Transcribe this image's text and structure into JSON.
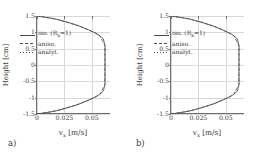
{
  "figure": {
    "panels": [
      {
        "letter": "a)",
        "xlabel_main": "v",
        "xlabel_sub": "x",
        "xlabel_unit": "[m/s]",
        "ylabel": "Height [cm]",
        "legend": [
          {
            "style": "solid",
            "label_main": "iso. (R",
            "label_sub": "b",
            "label_tail": "=1)"
          },
          {
            "style": "dashed",
            "label_main": "aniso.",
            "label_sub": "",
            "label_tail": ""
          },
          {
            "style": "dotted",
            "label_main": "analyt.",
            "label_sub": "",
            "label_tail": ""
          }
        ]
      },
      {
        "letter": "b)",
        "xlabel_main": "v",
        "xlabel_sub": "x",
        "xlabel_unit": "[m/s]",
        "ylabel": "Height [cm]",
        "legend": [
          {
            "style": "solid",
            "label_main": "iso. (R",
            "label_sub": "b",
            "label_tail": "=1)"
          },
          {
            "style": "dashed",
            "label_main": "aniso.",
            "label_sub": "",
            "label_tail": ""
          },
          {
            "style": "dotted",
            "label_main": "analyt.",
            "label_sub": "",
            "label_tail": ""
          }
        ]
      }
    ]
  },
  "chart_data": {
    "type": "line",
    "title": "",
    "xlabel": "v_x [m/s]",
    "ylabel": "Height [cm]",
    "xlim": [
      0,
      0.0675
    ],
    "ylim": [
      -1.5,
      1.5
    ],
    "xticks": [
      0,
      0.025,
      0.05
    ],
    "xticklabels": [
      "0",
      "0.025",
      "0.05"
    ],
    "yticks": [
      -1.5,
      -1,
      -0.5,
      0,
      0.5,
      1,
      1.5
    ],
    "yticklabels": [
      "-1.5",
      "-1",
      "-0.5",
      "0",
      "0.5",
      "1",
      "1.5"
    ],
    "grid": true,
    "legend_position": "center-left",
    "panels": [
      {
        "letter": "a)",
        "series": [
          {
            "name": "iso. (R_b=1)",
            "style": "solid",
            "comment": "plug-like velocity profile: v=0 at walls y=+/-1.5, plateau v=0.062 for |y|<0.95",
            "y": [
              1.5,
              1.45,
              1.4,
              1.3,
              1.2,
              1.1,
              1.0,
              0.95,
              0.9,
              0.8,
              0.6,
              0.4,
              0.2,
              0.0,
              -0.2,
              -0.4,
              -0.6,
              -0.8,
              -0.9,
              -0.95,
              -1.0,
              -1.1,
              -1.2,
              -1.3,
              -1.4,
              -1.45,
              -1.5
            ],
            "x": [
              0.0,
              0.0105,
              0.018,
              0.029,
              0.038,
              0.0455,
              0.052,
              0.0548,
              0.0572,
              0.0605,
              0.062,
              0.062,
              0.062,
              0.062,
              0.062,
              0.062,
              0.062,
              0.0605,
              0.0572,
              0.0548,
              0.052,
              0.0455,
              0.038,
              0.029,
              0.018,
              0.0105,
              0.0
            ]
          },
          {
            "name": "aniso.",
            "style": "dashed",
            "comment": "overlaps the isotropic curve almost exactly",
            "y": [
              1.5,
              1.4,
              1.2,
              1.0,
              0.9,
              0.6,
              0.0,
              -0.6,
              -0.9,
              -1.0,
              -1.2,
              -1.4,
              -1.5
            ],
            "x": [
              0.0,
              0.018,
              0.038,
              0.052,
              0.0572,
              0.062,
              0.062,
              0.062,
              0.0572,
              0.052,
              0.038,
              0.018,
              0.0
            ]
          },
          {
            "name": "analyt.",
            "style": "dotted",
            "comment": "analytic solution, overlaps both numerical curves",
            "y": [
              1.5,
              1.4,
              1.2,
              1.0,
              0.9,
              0.6,
              0.0,
              -0.6,
              -0.9,
              -1.0,
              -1.2,
              -1.4,
              -1.5
            ],
            "x": [
              0.0,
              0.018,
              0.038,
              0.052,
              0.0572,
              0.062,
              0.062,
              0.062,
              0.0572,
              0.052,
              0.038,
              0.018,
              0.0
            ]
          }
        ]
      },
      {
        "letter": "b)",
        "series": [
          {
            "name": "iso. (R_b=1)",
            "style": "solid",
            "comment": "plug-like velocity profile: v=0 at walls y=+/-1.5, plateau v=0.062 for |y|<0.95",
            "y": [
              1.5,
              1.45,
              1.4,
              1.3,
              1.2,
              1.1,
              1.0,
              0.95,
              0.9,
              0.8,
              0.6,
              0.4,
              0.2,
              0.0,
              -0.2,
              -0.4,
              -0.6,
              -0.8,
              -0.9,
              -0.95,
              -1.0,
              -1.1,
              -1.2,
              -1.3,
              -1.4,
              -1.45,
              -1.5
            ],
            "x": [
              0.0,
              0.0105,
              0.018,
              0.029,
              0.038,
              0.0455,
              0.052,
              0.0548,
              0.0572,
              0.0605,
              0.062,
              0.062,
              0.062,
              0.062,
              0.062,
              0.062,
              0.062,
              0.0605,
              0.0572,
              0.0548,
              0.052,
              0.0455,
              0.038,
              0.029,
              0.018,
              0.0105,
              0.0
            ]
          },
          {
            "name": "aniso.",
            "style": "dashed",
            "comment": "overlaps the isotropic curve almost exactly",
            "y": [
              1.5,
              1.4,
              1.2,
              1.0,
              0.9,
              0.6,
              0.0,
              -0.6,
              -0.9,
              -1.0,
              -1.2,
              -1.4,
              -1.5
            ],
            "x": [
              0.0,
              0.018,
              0.038,
              0.052,
              0.0572,
              0.062,
              0.062,
              0.062,
              0.0572,
              0.052,
              0.038,
              0.018,
              0.0
            ]
          },
          {
            "name": "analyt.",
            "style": "dotted",
            "comment": "analytic solution, overlaps both numerical curves",
            "y": [
              1.5,
              1.4,
              1.2,
              1.0,
              0.9,
              0.6,
              0.0,
              -0.6,
              -0.9,
              -1.0,
              -1.2,
              -1.4,
              -1.5
            ],
            "x": [
              0.0,
              0.018,
              0.038,
              0.052,
              0.0572,
              0.062,
              0.062,
              0.062,
              0.0572,
              0.052,
              0.038,
              0.018,
              0.0
            ]
          }
        ]
      }
    ]
  }
}
